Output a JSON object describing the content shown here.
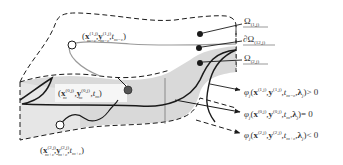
{
  "diagram": {
    "type": "3d-domain-boundary-illustration",
    "colors": {
      "stroke": "#1a1a1a",
      "surface_fill": "#d4d4d4",
      "surface_fill_light": "#e6e6e6",
      "grey_path": "#9a9a9a",
      "text": "#333333"
    },
    "points": {
      "upper": {
        "label": "(x_{m-ε}^{(1,j)}, y_{m-ε}^{(1,j)}, t_{m-ε})",
        "open_paren": "(",
        "x": "x",
        "x_sup": "(1,j)",
        "x_sub": "m−ε",
        "y": "y",
        "y_sup": "(1,j)",
        "y_sub": "m−ε",
        "t": "t",
        "t_sub": "m−ε",
        "close_paren": ")",
        "marker": "hollow-circle"
      },
      "middle": {
        "label": "(x_m^{(0,j)}, y_m^{(0,j)}, t_m)",
        "x": "x",
        "x_sup": "(0,j)",
        "x_sub": "m",
        "y": "y",
        "y_sup": "(0,j)",
        "y_sub": "m",
        "t": "t",
        "t_sub": "m",
        "marker": "filled-circle"
      },
      "lower": {
        "label": "(x_{m+ε}^{(2,j)}, y_{m+ε}^{(2,j)}, t_{m+ε})",
        "x": "x",
        "x_sup": "(2,j)",
        "x_sub": "m+ε",
        "y": "y",
        "y_sup": "(2,j)",
        "y_sub": "m+ε",
        "t": "t",
        "t_sub": "m+ε",
        "marker": "hollow-circle"
      }
    },
    "regions": [
      {
        "name": "Ω",
        "prefix": "",
        "sub": "(1,j)"
      },
      {
        "name": "Ω",
        "prefix": "∂",
        "sub": "(12,j)"
      },
      {
        "name": "Ω",
        "prefix": "",
        "sub": "(2,j)"
      }
    ],
    "conditions": [
      {
        "phi": "φ",
        "phi_sub": "j",
        "x_sup": "(1,j)",
        "y_sup": "(1,j)",
        "t_sub": "m−ε",
        "relation": "> 0",
        "arrow": "solid-thin"
      },
      {
        "phi": "φ",
        "phi_sub": "j",
        "x_sup": "(0,j)",
        "y_sup": "(0,j)",
        "t_sub": "m",
        "relation": "= 0",
        "arrow": "solid"
      },
      {
        "phi": "φ",
        "phi_sub": "j",
        "x_sup": "(2,j)",
        "y_sup": "(2,j)",
        "t_sub": "m+ε",
        "relation": "< 0",
        "arrow": "dashed"
      }
    ],
    "lambda": "λ",
    "lambda_sub": "j"
  }
}
